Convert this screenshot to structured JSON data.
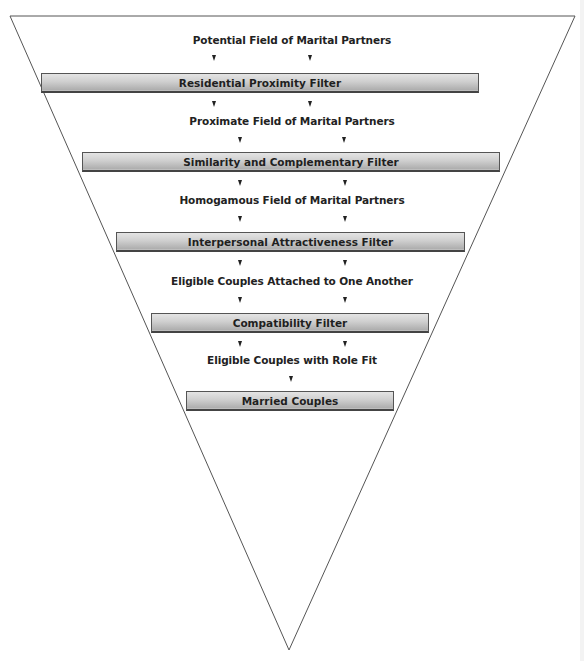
{
  "diagram": {
    "type": "inverted-funnel",
    "colors": {
      "outline": "#555555",
      "filter_bar_top": "#e4e4e4",
      "filter_bar_bottom": "#a9a9a9",
      "text": "#222222"
    },
    "stages": [
      {
        "kind": "field",
        "label": "Potential Field of Marital Partners"
      },
      {
        "kind": "filter",
        "label": "Residential Proximity Filter"
      },
      {
        "kind": "field",
        "label": "Proximate Field of Marital Partners"
      },
      {
        "kind": "filter",
        "label": "Similarity and Complementary Filter"
      },
      {
        "kind": "field",
        "label": "Homogamous Field of Marital Partners"
      },
      {
        "kind": "filter",
        "label": "Interpersonal Attractiveness Filter"
      },
      {
        "kind": "field",
        "label": "Eligible Couples Attached to One Another"
      },
      {
        "kind": "filter",
        "label": "Compatibility Filter"
      },
      {
        "kind": "field",
        "label": "Eligible Couples with Role Fit"
      },
      {
        "kind": "filter",
        "label": "Married Couples"
      }
    ]
  }
}
